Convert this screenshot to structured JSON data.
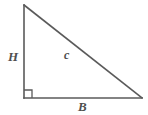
{
  "figure": {
    "kind": "right-triangle-diagram",
    "background_color": "#ffffff",
    "stroke_color": "#5a5a5a",
    "label_color": "#4f4f4f",
    "stroke_width": 1.6,
    "canvas": {
      "width": 148,
      "height": 115
    }
  },
  "geometry": {
    "vertices": {
      "top": {
        "x": 24,
        "y": 5
      },
      "bottom_left": {
        "x": 24,
        "y": 98
      },
      "bottom_right": {
        "x": 142,
        "y": 98
      }
    },
    "right_angle_marker": {
      "at": "bottom_left",
      "size": 8,
      "path": "M 24 90 L 32 90 L 32 98"
    },
    "edges": {
      "vertical_leg": "M 24 5 L 24 98",
      "horizontal_leg": "M 24 98 L 142 98",
      "hypotenuse": "M 24 5 L 142 98"
    }
  },
  "labels": {
    "vertical_leg": "H",
    "hypotenuse": "c",
    "horizontal_leg": "B"
  }
}
